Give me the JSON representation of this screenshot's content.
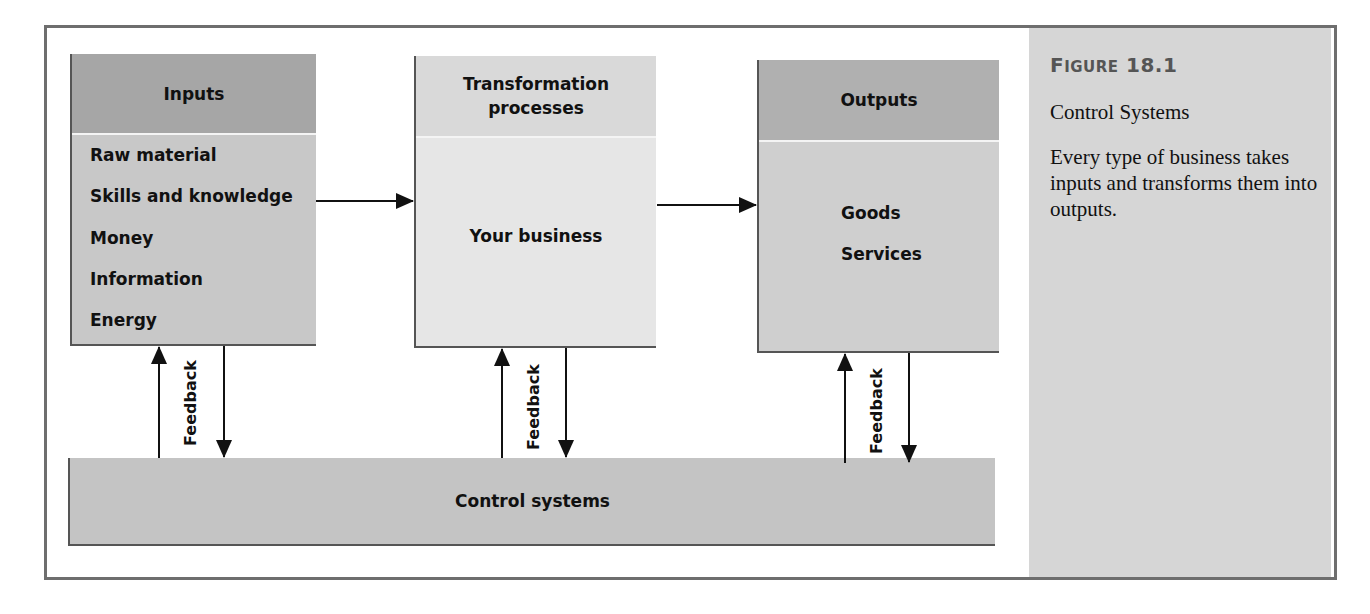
{
  "figure": {
    "number_prefix_cap": "F",
    "number_prefix_rest": "IGURE",
    "number": "18.1",
    "title": "Control Systems",
    "description": "Every type of business takes inputs and transforms them into outputs."
  },
  "diagram": {
    "inputs": {
      "header": "Inputs",
      "items": [
        "Raw material",
        "Skills and knowledge",
        "Money",
        "Information",
        "Energy"
      ]
    },
    "transformation": {
      "header_line1": "Transformation",
      "header_line2": "processes",
      "body": "Your business"
    },
    "outputs": {
      "header": "Outputs",
      "items": [
        "Goods",
        "Services"
      ]
    },
    "control": {
      "label": "Control systems"
    },
    "feedback_label": "Feedback"
  },
  "colors": {
    "frame_border": "#6e6e6e",
    "caption_bg": "#d6d6d6",
    "inputs_header": "#a6a6a6",
    "inputs_body": "#c8c8c8",
    "trans_header": "#d9d9d9",
    "trans_body": "#e6e6e6",
    "outputs_header": "#b0b0b0",
    "outputs_body": "#cfcfcf",
    "control_bg": "#c4c4c4",
    "figure_number": "#555555"
  }
}
